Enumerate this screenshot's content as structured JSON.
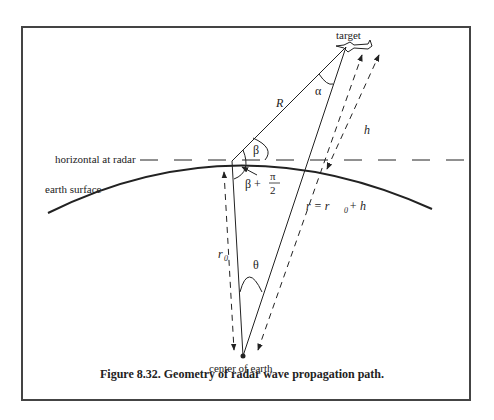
{
  "figure": {
    "caption": "Figure 8.32. Geometry of radar wave propagation path.",
    "labels": {
      "target": "target",
      "range": "R",
      "alpha": "α",
      "beta": "β",
      "beta_plus": "β +",
      "pi": "π",
      "two": "2",
      "height": "h",
      "horizontal": "horizontal at radar",
      "earth_surface": "earth surface",
      "r0": "r",
      "r0_sub": "0",
      "theta": "θ",
      "r_eq": "r  =  r",
      "r_eq_sub": "0",
      "r_eq_tail": " + h",
      "center": "center of earth"
    },
    "icons": [
      "aircraft-icon"
    ],
    "colors": {
      "line": "#222222",
      "frame": "#444444",
      "background": "#ffffff"
    }
  }
}
